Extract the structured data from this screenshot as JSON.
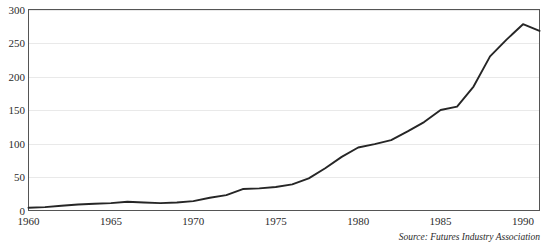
{
  "source_note": "Source: Futures Industry Association",
  "chart_data": {
    "type": "line",
    "title": "",
    "subtitle": "",
    "xlabel": "",
    "ylabel": "",
    "xlim": [
      1960,
      1991
    ],
    "ylim": [
      0,
      300
    ],
    "grid": true,
    "legend": "none",
    "y_ticks": [
      0,
      50,
      100,
      150,
      200,
      250,
      300
    ],
    "y_tick_labels": [
      "0",
      "50",
      "100",
      "150",
      "200",
      "250",
      "300"
    ],
    "x_ticks": [
      1960,
      1965,
      1970,
      1975,
      1980,
      1985,
      1990
    ],
    "x_tick_labels": [
      "1960",
      "1965",
      "1970",
      "1975",
      "1980",
      "1985",
      "1990"
    ],
    "line_color": "#262626",
    "grid_color": "#e9e9e9",
    "frame_color": "#555555",
    "x": [
      1960,
      1961,
      1962,
      1963,
      1964,
      1965,
      1966,
      1967,
      1968,
      1969,
      1970,
      1971,
      1972,
      1973,
      1974,
      1975,
      1976,
      1977,
      1978,
      1979,
      1980,
      1981,
      1982,
      1983,
      1984,
      1985,
      1986,
      1987,
      1988,
      1989,
      1990,
      1991
    ],
    "series": [
      {
        "name": "Futures contracts traded (millions)",
        "values": [
          4,
          5,
          7,
          9,
          10,
          11,
          13,
          12,
          11,
          12,
          14,
          19,
          23,
          32,
          33,
          35,
          39,
          48,
          63,
          80,
          94,
          99,
          105,
          118,
          132,
          150,
          155,
          185,
          230,
          255,
          278,
          268
        ]
      }
    ]
  }
}
